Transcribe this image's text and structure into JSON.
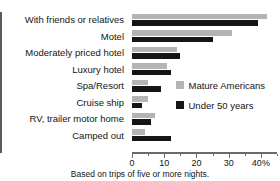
{
  "chart_data": {
    "type": "bar",
    "orientation": "horizontal",
    "title": "",
    "xlabel": "",
    "ylabel": "",
    "xlim": [
      0,
      45
    ],
    "grid": false,
    "legend_position": "inside-right",
    "categories": [
      "With friends or relatives",
      "Motel",
      "Moderately priced hotel",
      "Luxury hotel",
      "Spa/Resort",
      "Cruise ship",
      "RV, trailer motor home",
      "Camped out"
    ],
    "series": [
      {
        "name": "Mature Americans",
        "color": "#b4b4b4",
        "values": [
          42,
          31,
          14,
          11,
          5,
          5,
          7,
          4
        ]
      },
      {
        "name": "Under 50 years",
        "color": "#151515",
        "values": [
          39,
          25,
          15,
          12,
          9,
          3,
          6,
          12
        ]
      }
    ],
    "xticks_major": [
      0,
      10,
      20,
      30,
      40
    ],
    "xtick_labels": [
      "0",
      "10",
      "20",
      "30",
      "40%"
    ],
    "xticks_minor": [
      5,
      15,
      25,
      35,
      45
    ],
    "footnote": "Based on trips of five or more nights."
  }
}
